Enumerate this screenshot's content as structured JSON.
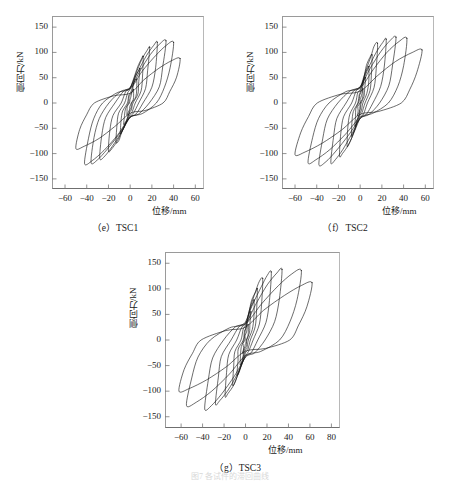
{
  "page": {
    "background": "#ffffff",
    "width": 460,
    "height": 481,
    "figure_caption": "图7 各试件的滞回曲线"
  },
  "charts": [
    {
      "id": "tsc1",
      "caption": "（e）TSC1",
      "xlabel": "位移/mm",
      "ylabel": "侧向力/kN",
      "xticks": [
        "-60",
        "-40",
        "-20",
        "0",
        "20",
        "40",
        "60"
      ],
      "xtick_values": [
        -60,
        -40,
        -20,
        0,
        20,
        40,
        60
      ],
      "yticks": [
        "150",
        "100",
        "50",
        "0",
        "-50",
        "-100",
        "-150"
      ],
      "ytick_values": [
        150,
        100,
        50,
        0,
        -50,
        -100,
        -150
      ],
      "xlim": [
        -72,
        68
      ],
      "ylim": [
        -170,
        172
      ]
    },
    {
      "id": "tsc2",
      "caption": "（f）TSC2",
      "xlabel": "位移/mm",
      "ylabel": "侧向力/kN",
      "xticks": [
        "-60",
        "-40",
        "-20",
        "0",
        "20",
        "40",
        "60"
      ],
      "xtick_values": [
        -60,
        -40,
        -20,
        0,
        20,
        40,
        60
      ],
      "yticks": [
        "150",
        "100",
        "50",
        "0",
        "-50",
        "-100",
        "-150"
      ],
      "ytick_values": [
        150,
        100,
        50,
        0,
        -50,
        -100,
        -150
      ],
      "xlim": [
        -72,
        68
      ],
      "ylim": [
        -170,
        172
      ]
    },
    {
      "id": "tsc3",
      "caption": "（g）TSC3",
      "xlabel": "位移/mm",
      "ylabel": "侧向力/kN",
      "xticks": [
        "-60",
        "-40",
        "-20",
        "0",
        "20",
        "40",
        "60",
        "80"
      ],
      "xtick_values": [
        -60,
        -40,
        -20,
        0,
        20,
        40,
        60,
        80
      ],
      "yticks": [
        "150",
        "100",
        "50",
        "0",
        "-50",
        "-100",
        "-150"
      ],
      "ytick_values": [
        150,
        100,
        50,
        0,
        -50,
        -100,
        -150
      ],
      "xlim": [
        -75,
        88
      ],
      "ylim": [
        -172,
        172
      ]
    }
  ],
  "chart_data": [
    {
      "type": "line",
      "id": "tsc1",
      "title": "（e）TSC1",
      "xlabel": "位移/mm",
      "ylabel": "侧向力/kN",
      "xlim": [
        -72,
        68
      ],
      "ylim": [
        -170,
        172
      ],
      "grid": false,
      "legend": null,
      "description": "Lateral force vs displacement hysteresis loops (cyclic loading), 9 nested loops of increasing amplitude",
      "series": [
        {
          "name": "cycle-1",
          "peak_disp": 3.0,
          "peak_force": 27,
          "neg_disp": -3.0,
          "neg_force": -24
        },
        {
          "name": "cycle-2",
          "peak_disp": 6.0,
          "peak_force": 47,
          "neg_disp": -6.0,
          "neg_force": -42
        },
        {
          "name": "cycle-3",
          "peak_disp": 9.0,
          "peak_force": 68,
          "neg_disp": -9.0,
          "neg_force": -60
        },
        {
          "name": "cycle-4",
          "peak_disp": 12.0,
          "peak_force": 92,
          "neg_disp": -13.0,
          "neg_force": -78
        },
        {
          "name": "cycle-5",
          "peak_disp": 18.0,
          "peak_force": 110,
          "neg_disp": -20.0,
          "neg_force": -95
        },
        {
          "name": "cycle-6",
          "peak_disp": 25.0,
          "peak_force": 120,
          "neg_disp": -28.0,
          "neg_force": -110
        },
        {
          "name": "cycle-7",
          "peak_disp": 33.0,
          "peak_force": 123,
          "neg_disp": -36.0,
          "neg_force": -118
        },
        {
          "name": "cycle-8",
          "peak_disp": 40.0,
          "peak_force": 120,
          "neg_disp": -42.0,
          "neg_force": -120
        },
        {
          "name": "cycle-9",
          "peak_disp": 46.0,
          "peak_force": 88,
          "neg_disp": -50.0,
          "neg_force": -90
        }
      ]
    },
    {
      "type": "line",
      "id": "tsc2",
      "title": "（f）TSC2",
      "xlabel": "位移/mm",
      "ylabel": "侧向力/kN",
      "xlim": [
        -72,
        68
      ],
      "ylim": [
        -170,
        172
      ],
      "grid": false,
      "legend": null,
      "description": "Lateral force vs displacement hysteresis loops (cyclic loading), 9 nested loops of increasing amplitude",
      "series": [
        {
          "name": "cycle-1",
          "peak_disp": 2.5,
          "peak_force": 28,
          "neg_disp": -2.5,
          "neg_force": -25
        },
        {
          "name": "cycle-2",
          "peak_disp": 5.0,
          "peak_force": 50,
          "neg_disp": -5.0,
          "neg_force": -45
        },
        {
          "name": "cycle-3",
          "peak_disp": 8.0,
          "peak_force": 72,
          "neg_disp": -8.0,
          "neg_force": -65
        },
        {
          "name": "cycle-4",
          "peak_disp": 11.0,
          "peak_force": 95,
          "neg_disp": -12.0,
          "neg_force": -85
        },
        {
          "name": "cycle-5",
          "peak_disp": 16.0,
          "peak_force": 118,
          "neg_disp": -19.0,
          "neg_force": -105
        },
        {
          "name": "cycle-6",
          "peak_disp": 24.0,
          "peak_force": 126,
          "neg_disp": -27.0,
          "neg_force": -118
        },
        {
          "name": "cycle-7",
          "peak_disp": 33.0,
          "peak_force": 130,
          "neg_disp": -38.0,
          "neg_force": -122
        },
        {
          "name": "cycle-8",
          "peak_disp": 43.0,
          "peak_force": 128,
          "neg_disp": -48.0,
          "neg_force": -118
        },
        {
          "name": "cycle-9",
          "peak_disp": 57.0,
          "peak_force": 105,
          "neg_disp": -60.0,
          "neg_force": -102
        }
      ]
    },
    {
      "type": "line",
      "id": "tsc3",
      "title": "（g）TSC3",
      "xlabel": "位移/mm",
      "ylabel": "侧向力/kN",
      "xlim": [
        -75,
        88
      ],
      "ylim": [
        -172,
        172
      ],
      "grid": false,
      "legend": null,
      "description": "Lateral force vs displacement hysteresis loops (cyclic loading), 9 nested loops of increasing amplitude",
      "series": [
        {
          "name": "cycle-1",
          "peak_disp": 2.5,
          "peak_force": 30,
          "neg_disp": -2.5,
          "neg_force": -26
        },
        {
          "name": "cycle-2",
          "peak_disp": 5.0,
          "peak_force": 55,
          "neg_disp": -5.0,
          "neg_force": -48
        },
        {
          "name": "cycle-3",
          "peak_disp": 8.0,
          "peak_force": 78,
          "neg_disp": -8.0,
          "neg_force": -68
        },
        {
          "name": "cycle-4",
          "peak_disp": 11.0,
          "peak_force": 100,
          "neg_disp": -12.0,
          "neg_force": -88
        },
        {
          "name": "cycle-5",
          "peak_disp": 16.0,
          "peak_force": 120,
          "neg_disp": -19.0,
          "neg_force": -110
        },
        {
          "name": "cycle-6",
          "peak_disp": 24.0,
          "peak_force": 133,
          "neg_disp": -28.0,
          "neg_force": -125
        },
        {
          "name": "cycle-7",
          "peak_disp": 34.0,
          "peak_force": 138,
          "neg_disp": -38.0,
          "neg_force": -135
        },
        {
          "name": "cycle-8",
          "peak_disp": 52.0,
          "peak_force": 136,
          "neg_disp": -55.0,
          "neg_force": -128
        },
        {
          "name": "cycle-9",
          "peak_disp": 62.0,
          "peak_force": 112,
          "neg_disp": -62.0,
          "neg_force": -100
        }
      ]
    }
  ]
}
